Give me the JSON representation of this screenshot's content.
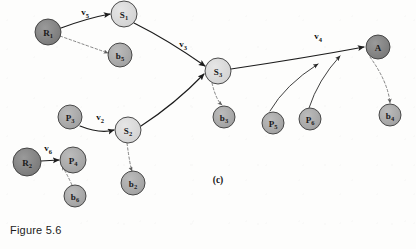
{
  "figure": {
    "caption": "Figure 5.6",
    "panel_label": "(c)",
    "panel_label_x": 218,
    "panel_label_y": 183
  },
  "colors": {
    "node_dark": "#808080",
    "node_medium": "#a8a8a8",
    "node_light": "#d8d8d8",
    "node_stroke": "#3a3a3a",
    "edge_solid": "#1c1c1c",
    "edge_dashed": "#6f6f6f",
    "text": "#111111",
    "background": "#fdfdfc"
  },
  "chart_data": {
    "type": "diagram",
    "nodes": [
      {
        "id": "R1",
        "base": "R",
        "sub": "1",
        "x": 48,
        "y": 32,
        "r": 13,
        "shade": "node_dark"
      },
      {
        "id": "S1",
        "base": "S",
        "sub": "1",
        "x": 124,
        "y": 14,
        "r": 13,
        "shade": "node_light"
      },
      {
        "id": "b5",
        "base": "b",
        "sub": "5",
        "x": 120,
        "y": 55,
        "r": 12,
        "shade": "node_medium"
      },
      {
        "id": "S3",
        "base": "S",
        "sub": "3",
        "x": 218,
        "y": 71,
        "r": 13,
        "shade": "node_light"
      },
      {
        "id": "b3",
        "base": "b",
        "sub": "3",
        "x": 224,
        "y": 117,
        "r": 11,
        "shade": "node_medium"
      },
      {
        "id": "A",
        "base": "A",
        "sub": "",
        "x": 378,
        "y": 47,
        "r": 12,
        "shade": "node_dark"
      },
      {
        "id": "b4",
        "base": "b",
        "sub": "4",
        "x": 390,
        "y": 115,
        "r": 11,
        "shade": "node_medium"
      },
      {
        "id": "P5",
        "base": "P",
        "sub": "5",
        "x": 273,
        "y": 123,
        "r": 11,
        "shade": "node_medium"
      },
      {
        "id": "P6",
        "base": "P",
        "sub": "6",
        "x": 310,
        "y": 119,
        "r": 11,
        "shade": "node_medium"
      },
      {
        "id": "P3",
        "base": "P",
        "sub": "3",
        "x": 70,
        "y": 117,
        "r": 12,
        "shade": "node_medium"
      },
      {
        "id": "S2",
        "base": "S",
        "sub": "2",
        "x": 128,
        "y": 130,
        "r": 13,
        "shade": "node_light"
      },
      {
        "id": "R2",
        "base": "R",
        "sub": "2",
        "x": 27,
        "y": 162,
        "r": 14,
        "shade": "node_dark"
      },
      {
        "id": "P4",
        "base": "P",
        "sub": "4",
        "x": 73,
        "y": 160,
        "r": 13,
        "shade": "node_medium"
      },
      {
        "id": "b6",
        "base": "b",
        "sub": "6",
        "x": 75,
        "y": 196,
        "r": 11,
        "shade": "node_medium"
      },
      {
        "id": "b2",
        "base": "b",
        "sub": "2",
        "x": 133,
        "y": 183,
        "r": 12,
        "shade": "node_medium"
      }
    ],
    "edge_labels": [
      {
        "id": "v5",
        "base": "v",
        "sub": "5",
        "x": 85,
        "y": 12
      },
      {
        "id": "v3",
        "base": "v",
        "sub": "3",
        "x": 183,
        "y": 44
      },
      {
        "id": "v4",
        "base": "v",
        "sub": "4",
        "x": 318,
        "y": 36
      },
      {
        "id": "v2",
        "base": "v",
        "sub": "2",
        "x": 100,
        "y": 117
      },
      {
        "id": "v6",
        "base": "v",
        "sub": "6",
        "x": 48,
        "y": 148
      }
    ],
    "solid_edges": [
      {
        "from": "R1",
        "to": "S1",
        "label": "v5",
        "path": "M 61 28 Q 88 18 110 14"
      },
      {
        "from": "S1",
        "to": "S3",
        "label": "v3",
        "path": "M 134 23 Q 168 40 205 66"
      },
      {
        "from": "S2",
        "to": "S3",
        "label": "v3",
        "path": "M 141 126 Q 175 104 204 74"
      },
      {
        "from": "S3",
        "to": "A",
        "label": "v4",
        "path": "M 231 69 Q 305 58 364 47"
      },
      {
        "from": "P3",
        "to": "S2",
        "label": "v2",
        "path": "M 80 126 Q 100 134 114 130"
      },
      {
        "from": "R2",
        "to": "P4",
        "label": "v6",
        "path": "M 41 161 L 59 160"
      },
      {
        "from": "P5",
        "to": "A",
        "label": "",
        "path": "M 270 111 Q 285 85 318 64"
      },
      {
        "from": "P6",
        "to": "A",
        "label": "",
        "path": "M 309 108 Q 318 80 340 56"
      }
    ],
    "dashed_edges": [
      {
        "from": "R1",
        "to": "b5",
        "path": "M 60 36 Q 88 46 108 53"
      },
      {
        "from": "S3",
        "to": "b3",
        "path": "M 212 83 Q 216 100 222 105"
      },
      {
        "from": "A",
        "to": "b4",
        "path": "M 370 57 Q 388 82 390 103"
      },
      {
        "from": "S2",
        "to": "b2",
        "path": "M 127 143 Q 130 166 132 171"
      },
      {
        "from": "b6",
        "to": "P4",
        "path": "M 72 185 Q 66 172 62 166"
      }
    ]
  }
}
